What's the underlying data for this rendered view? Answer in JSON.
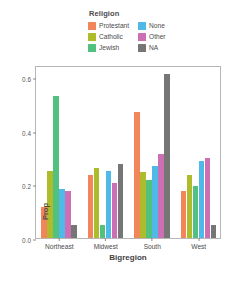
{
  "chart_data": {
    "type": "bar",
    "title": "",
    "xlabel": "Bigregion",
    "ylabel": "Prop",
    "categories": [
      "Northeast",
      "Midwest",
      "South",
      "West"
    ],
    "ylim": [
      0.0,
      0.645
    ],
    "yticks": [
      0.0,
      0.2,
      0.4,
      0.6
    ],
    "ytick_labels": [
      "0.0",
      "0.2",
      "0.4",
      "0.6"
    ],
    "grid": false,
    "legend_title": "Religion",
    "legend_position": "top",
    "series": [
      {
        "name": "Protestant",
        "color": "#f2855a",
        "values": [
          0.115,
          0.235,
          0.47,
          0.175
        ]
      },
      {
        "name": "Catholic",
        "color": "#aebb2b",
        "values": [
          0.248,
          0.262,
          0.245,
          0.235
        ]
      },
      {
        "name": "Jewish",
        "color": "#52c17f",
        "values": [
          0.53,
          0.05,
          0.215,
          0.195
        ]
      },
      {
        "name": "None",
        "color": "#4fb9e8",
        "values": [
          0.182,
          0.25,
          0.27,
          0.287
        ]
      },
      {
        "name": "Other",
        "color": "#cc6fb4",
        "values": [
          0.176,
          0.205,
          0.312,
          0.3
        ]
      },
      {
        "name": "NA",
        "color": "#767676",
        "values": [
          0.05,
          0.275,
          0.61,
          0.05
        ]
      }
    ]
  },
  "legend": {
    "title": "Religion",
    "columns": [
      [
        {
          "label": "Protestant",
          "color": "#f2855a"
        },
        {
          "label": "Catholic",
          "color": "#aebb2b"
        },
        {
          "label": "Jewish",
          "color": "#52c17f"
        }
      ],
      [
        {
          "label": "None",
          "color": "#4fb9e8"
        },
        {
          "label": "Other",
          "color": "#cc6fb4"
        },
        {
          "label": "NA",
          "color": "#767676"
        }
      ]
    ]
  },
  "caption": {
    "text": ""
  }
}
